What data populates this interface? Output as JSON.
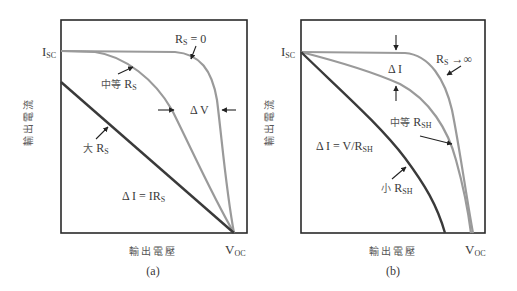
{
  "panel_a": {
    "caption": "(a)",
    "y_axis_label": "輸出電流",
    "x_axis_label": "輸出電壓",
    "isc_label": "I",
    "isc_sub": "SC",
    "voc_label": "V",
    "voc_sub": "OC",
    "curves": [
      {
        "name": "Rs = 0",
        "label_main": "R",
        "label_sub": "S",
        "label_suffix": " = 0"
      },
      {
        "name": "medium Rs",
        "label_prefix": "中等 ",
        "label_main": "R",
        "label_sub": "S"
      },
      {
        "name": "large Rs",
        "label_prefix": "大 ",
        "label_main": "R",
        "label_sub": "S"
      }
    ],
    "delta_v_label": "Δ V",
    "delta_i_label_main": "Δ I = IR",
    "delta_i_label_sub": "S"
  },
  "panel_b": {
    "caption": "(b)",
    "y_axis_label": "輸出電流",
    "x_axis_label": "輸出電壓",
    "isc_label": "I",
    "isc_sub": "SC",
    "voc_label": "V",
    "voc_sub": "OC",
    "curves": [
      {
        "name": "Rs -> infinity",
        "label_main": "R",
        "label_sub": "S",
        "label_suffix": " →∞"
      },
      {
        "name": "medium Rsh",
        "label_prefix": "中等 ",
        "label_main": "R",
        "label_sub": "SH"
      },
      {
        "name": "small Rsh",
        "label_prefix": "小 ",
        "label_main": "R",
        "label_sub": "SH"
      }
    ],
    "delta_i_label": "Δ I",
    "delta_i_eq_main": "Δ I = V/R",
    "delta_i_eq_sub": "SH"
  },
  "colors": {
    "frame": "#2a2a2a",
    "light_curve": "#9a9a9a",
    "dark_curve": "#3a3a3a",
    "arrow": "#222222"
  }
}
